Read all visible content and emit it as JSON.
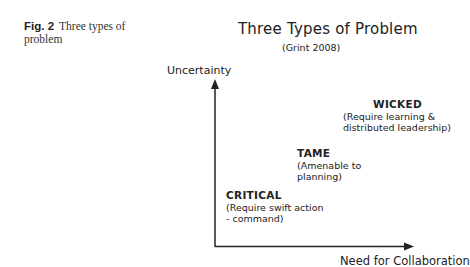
{
  "caption": {
    "label": "Fig. 2",
    "text": "Three types of problem"
  },
  "diagram": {
    "title": "Three Types of Problem",
    "subtitle": "(Grint 2008)",
    "y_axis_label": "Uncertainty",
    "x_axis_label": "Need for Collaboration",
    "types": [
      {
        "name": "CRITICAL",
        "description_line1": "(Require swift action",
        "description_line2": "- command)"
      },
      {
        "name": "TAME",
        "description_line1": "(Amenable to",
        "description_line2": "planning)"
      },
      {
        "name": "WICKED",
        "description_line1": "(Require learning &",
        "description_line2": "distributed leadership)"
      }
    ]
  }
}
